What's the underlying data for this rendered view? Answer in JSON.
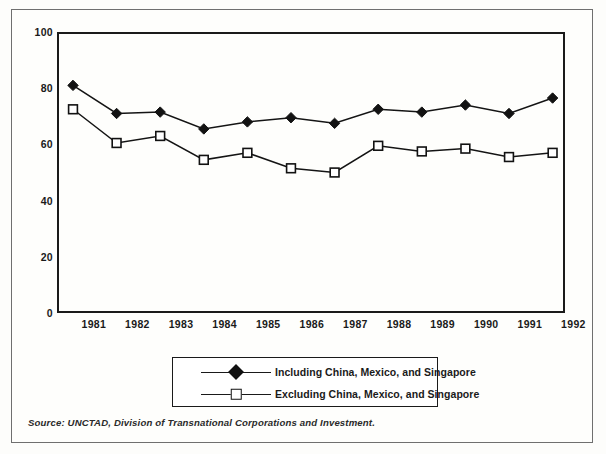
{
  "figure": {
    "source_note": "Source: UNCTAD, Division of Transnational Corporations and Investment."
  },
  "chart_data": {
    "type": "line",
    "title": "",
    "subtitle": "",
    "xlabel": "",
    "ylabel": "",
    "xlim": [
      1980.6,
      1992.6
    ],
    "ylim": [
      0,
      100
    ],
    "grid": false,
    "legend_position": "below-center",
    "categories": [
      "1981",
      "1982",
      "1983",
      "1984",
      "1985",
      "1986",
      "1987",
      "1988",
      "1989",
      "1990",
      "1991",
      "1992"
    ],
    "x_tick_labels": [
      "1981",
      "1982",
      "1983",
      "1984",
      "1985",
      "1986",
      "1987",
      "1988",
      "1989",
      "1990",
      "1991",
      "1992"
    ],
    "y_tick_labels": [
      "0",
      "20",
      "40",
      "60",
      "80",
      "100"
    ],
    "y_ticks": [
      0,
      20,
      40,
      60,
      80,
      100
    ],
    "series": [
      {
        "name": "Including China, Mexico, and Singapore",
        "marker": "filled-diamond",
        "color": "#121212",
        "values": [
          81,
          71,
          71.5,
          65.5,
          68,
          69.5,
          67.5,
          72.5,
          71.5,
          74,
          71,
          76.5
        ]
      },
      {
        "name": "Excluding China, Mexico, and Singapore",
        "marker": "open-square",
        "color": "#121212",
        "values": [
          72.5,
          60.5,
          63,
          54.5,
          57,
          51.5,
          50,
          59.5,
          57.5,
          58.5,
          55.5,
          57
        ]
      }
    ]
  },
  "legend": {
    "entries": [
      {
        "label": "Including China, Mexico, and Singapore",
        "marker": "filled-diamond"
      },
      {
        "label": "Excluding China, Mexico, and Singapore",
        "marker": "open-square"
      }
    ]
  }
}
